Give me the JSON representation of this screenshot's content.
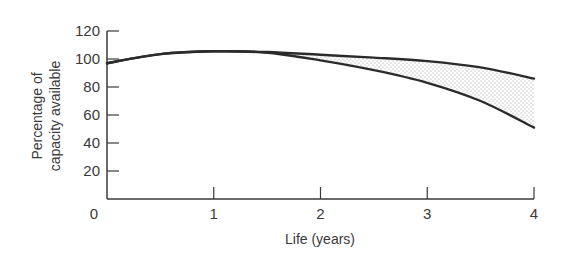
{
  "chart_data": {
    "type": "line",
    "title": "",
    "xlabel": "Life (years)",
    "ylabel": [
      "Percentage of",
      "capacity available"
    ],
    "xlim": [
      0,
      4
    ],
    "ylim": [
      0,
      120
    ],
    "x_ticks": [
      0,
      1,
      2,
      3,
      4
    ],
    "y_ticks": [
      20,
      40,
      60,
      80,
      100,
      120
    ],
    "grid": false,
    "legend": null,
    "x": [
      0,
      0.5,
      1,
      1.5,
      2,
      2.5,
      3,
      3.5,
      4
    ],
    "series": [
      {
        "name": "upper-bound",
        "values": [
          97,
          103.5,
          105.5,
          105,
          103,
          101,
          98.5,
          94,
          86
        ]
      },
      {
        "name": "lower-bound",
        "values": [
          97,
          103.5,
          105.5,
          104.5,
          99,
          92,
          83,
          70,
          51
        ]
      }
    ],
    "annotations": [
      "Stippled shaded region between upper and lower curves from ~1.3 to 4 years"
    ]
  },
  "style": {
    "line_color": "#2b2b2b",
    "axis_color": "#3a3a3a",
    "fill_dot_color": "#9a9a9a"
  }
}
